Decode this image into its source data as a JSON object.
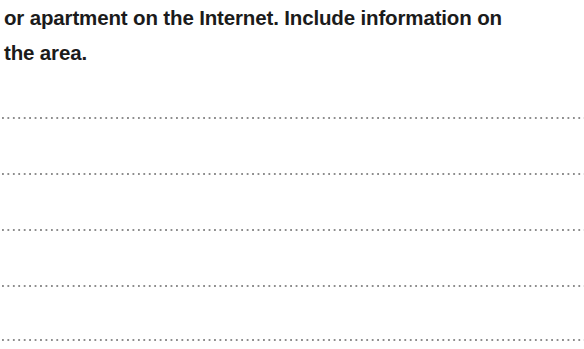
{
  "page": {
    "background_color": "#ffffff",
    "text_color": "#1b1b1b",
    "rule_color": "#8d8d8d",
    "width": 584,
    "height": 349
  },
  "prompt": {
    "lines": [
      "or apartment on the Internet. Include information on",
      "the area."
    ],
    "line_1": "or apartment on the Internet. Include information on",
    "line_2": "the area."
  },
  "answer_lines": {
    "count": 5,
    "style": "dotted",
    "items": [
      {
        "index": 1,
        "y": 117
      },
      {
        "index": 2,
        "y": 173
      },
      {
        "index": 3,
        "y": 229
      },
      {
        "index": 4,
        "y": 285
      },
      {
        "index": 5,
        "y": 339
      }
    ]
  }
}
